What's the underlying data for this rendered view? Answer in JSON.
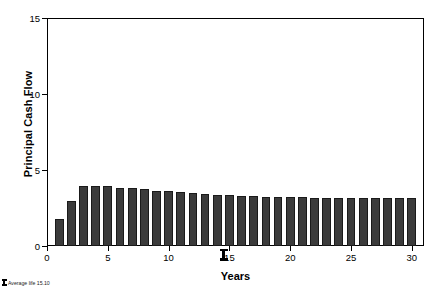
{
  "chart_data": {
    "type": "bar",
    "title": "",
    "xlabel": "Years",
    "ylabel": "Principal Cash Flow",
    "xlim": [
      0,
      31
    ],
    "ylim": [
      0,
      15
    ],
    "grid": false,
    "legend": null,
    "x_ticks": [
      0,
      5,
      10,
      15,
      20,
      25,
      30
    ],
    "x_tick_labels": [
      "0",
      "5",
      "10",
      "15",
      "20",
      "25",
      "30"
    ],
    "y_ticks": [
      0,
      5,
      10,
      15
    ],
    "y_tick_labels": [
      "0",
      "5",
      "10",
      "15"
    ],
    "bar_color": "#3b3b3b",
    "categories": [
      1,
      2,
      3,
      4,
      5,
      6,
      7,
      8,
      9,
      10,
      11,
      12,
      13,
      14,
      15,
      16,
      17,
      18,
      19,
      20,
      21,
      22,
      23,
      24,
      25,
      26,
      27,
      28,
      29,
      30
    ],
    "values": [
      1.75,
      2.95,
      3.93,
      3.97,
      3.92,
      3.84,
      3.79,
      3.72,
      3.65,
      3.6,
      3.54,
      3.48,
      3.44,
      3.38,
      3.35,
      3.3,
      3.27,
      3.25,
      3.23,
      3.21,
      3.2,
      3.19,
      3.18,
      3.17,
      3.17,
      3.16,
      3.16,
      3.16,
      3.15,
      3.15
    ],
    "annotations": [
      {
        "name": "average-life-marker",
        "x": 14.55,
        "label": "",
        "description": "bold I-beam marker on x axis indicating average life"
      }
    ]
  },
  "axes": {
    "y_title": "Principal Cash Flow",
    "x_title": "Years"
  },
  "footnote": {
    "text": "Average life 15.10"
  }
}
